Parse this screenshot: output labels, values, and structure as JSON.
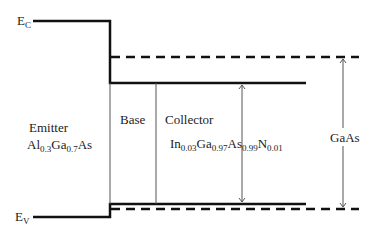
{
  "diagram": {
    "type": "band-diagram",
    "labels": {
      "ec": {
        "main": "E",
        "sub": "C"
      },
      "ev": {
        "main": "E",
        "sub": "V"
      },
      "emitter": "Emitter",
      "emitter_material": {
        "p1": "Al",
        "s1": "0.3",
        "p2": "Ga",
        "s2": "0.7",
        "p3": "As"
      },
      "base": "Base",
      "collector": "Collector",
      "collector_material": {
        "p1": "In",
        "s1": "0.03",
        "p2": "Ga",
        "s2": "0.97",
        "p3": "As",
        "s3": "0.99",
        "p4": "N",
        "s4": "0.01"
      },
      "gaas": "GaAs"
    },
    "colors": {
      "band_line": "#111111",
      "thin_line": "#555555",
      "text": "#222222"
    }
  }
}
